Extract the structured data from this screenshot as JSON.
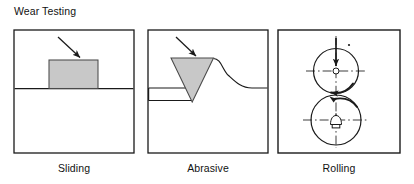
{
  "figure": {
    "title": "Wear Testing",
    "background_color": "#ffffff",
    "line_color": "#1a1a1a",
    "fill_gray": "#c8c8c8"
  },
  "panels": [
    {
      "id": "sliding",
      "caption": "Sliding",
      "frame": {
        "x": 14,
        "y": 30,
        "width": 120,
        "height": 123
      },
      "elements": {
        "surface_line_label": "surface line",
        "block_label": "sliding block",
        "arrow_label": "applied load arrow"
      }
    },
    {
      "id": "abrasive",
      "caption": "Abrasive",
      "frame": {
        "x": 148,
        "y": 30,
        "width": 120,
        "height": 123
      },
      "elements": {
        "indenter_label": "abrasive indenter",
        "groove_label": "groove profile curve",
        "arrow_label": "applied load arrow"
      }
    },
    {
      "id": "rolling",
      "caption": "Rolling",
      "frame": {
        "x": 278,
        "y": 30,
        "width": 122,
        "height": 123
      },
      "elements": {
        "upper_roller_label": "upper roller",
        "lower_roller_label": "lower roller",
        "load_arrow_label": "applied load arrow",
        "rotation_arrow_label": "rotation direction arrow",
        "fixture_label": "drive fixture symbol",
        "centerline_label": "centerline"
      }
    }
  ]
}
